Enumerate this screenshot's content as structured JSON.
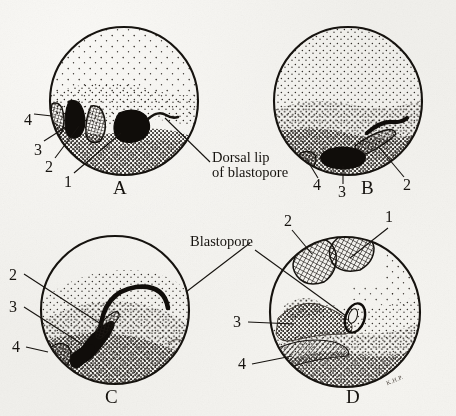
{
  "figure": {
    "domain": "scientific-illustration",
    "background_color": "#f1f0ec",
    "ink_color": "#16130f"
  },
  "panels": [
    {
      "id": "A",
      "letter": "A",
      "letter_pos": {
        "x": 113,
        "y": 186
      },
      "circle": {
        "cx": 124,
        "cy": 101,
        "r": 75
      },
      "numeric_labels": [
        {
          "text": "4",
          "x": 24,
          "y": 112
        },
        {
          "text": "3",
          "x": 34,
          "y": 143
        },
        {
          "text": "2",
          "x": 45,
          "y": 161
        },
        {
          "text": "1",
          "x": 64,
          "y": 177
        }
      ]
    },
    {
      "id": "B",
      "letter": "B",
      "letter_pos": {
        "x": 361,
        "y": 186
      },
      "circle": {
        "cx": 348,
        "cy": 101,
        "r": 75
      },
      "numeric_labels": [
        {
          "text": "4",
          "x": 314,
          "y": 186
        },
        {
          "text": "3",
          "x": 339,
          "y": 192
        },
        {
          "text": "2",
          "x": 404,
          "y": 186
        }
      ]
    },
    {
      "id": "C",
      "letter": "C",
      "letter_pos": {
        "x": 105,
        "y": 395
      },
      "circle": {
        "cx": 115,
        "cy": 310,
        "r": 75
      },
      "numeric_labels": [
        {
          "text": "2",
          "x": 10,
          "y": 278
        },
        {
          "text": "3",
          "x": 10,
          "y": 311
        },
        {
          "text": "4",
          "x": 13,
          "y": 351
        }
      ]
    },
    {
      "id": "D",
      "letter": "D",
      "letter_pos": {
        "x": 346,
        "y": 395
      },
      "circle": {
        "cx": 345,
        "cy": 312,
        "r": 76
      },
      "numeric_labels": [
        {
          "text": "2",
          "x": 285,
          "y": 222
        },
        {
          "text": "1",
          "x": 386,
          "y": 218
        },
        {
          "text": "3",
          "x": 234,
          "y": 323
        },
        {
          "text": "4",
          "x": 239,
          "y": 366
        }
      ]
    }
  ],
  "callouts": [
    {
      "name": "dorsal-lip-of-blastopore",
      "lines": [
        "Dorsal lip",
        "of blastopore"
      ],
      "x": 212,
      "y": 150
    },
    {
      "name": "blastopore",
      "lines": [
        "Blastopore"
      ],
      "x": 190,
      "y": 234
    }
  ],
  "signature": {
    "text": "K.H.P.",
    "x": 386,
    "y": 381
  },
  "legend_keys": [
    "1",
    "2",
    "3",
    "4"
  ]
}
